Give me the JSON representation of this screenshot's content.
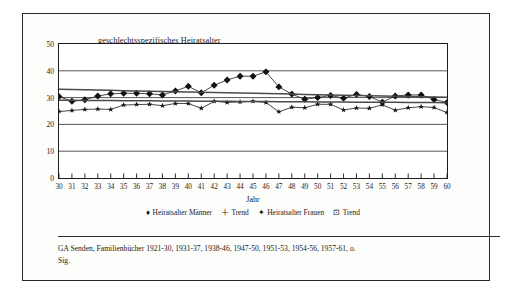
{
  "figure": {
    "title": "geschlechtsspezifisches Heiratsalter",
    "caption": "GA Senden, Familienbücher 1921-30, 1931-37, 1938-46, 1947-50, 1951-53, 1954-56, 1957-61, o. Sig."
  },
  "legend": {
    "items": [
      {
        "label": "Heiratsalter Männer",
        "glyph": "♦",
        "icon": "diamond-marker-icon"
      },
      {
        "label": "Trend",
        "glyph": "＋",
        "icon": "plus-marker-icon"
      },
      {
        "label": "Heiratsalter Frauen",
        "glyph": "✦",
        "icon": "star-marker-icon"
      },
      {
        "label": "Trend",
        "glyph": "⊡",
        "icon": "square-marker-icon"
      }
    ]
  },
  "chart_data": {
    "type": "line",
    "title": "geschlechtsspezifisches Heiratsalter",
    "xlabel": "Jahr",
    "ylabel": "",
    "xlim": [
      30,
      60
    ],
    "ylim": [
      0,
      50
    ],
    "yticks": [
      0,
      10,
      20,
      30,
      40,
      50
    ],
    "grid": "horizontal",
    "legend_position": "bottom",
    "x": [
      30,
      31,
      32,
      33,
      34,
      35,
      36,
      37,
      38,
      39,
      40,
      41,
      42,
      43,
      44,
      45,
      46,
      47,
      48,
      49,
      50,
      51,
      52,
      53,
      54,
      55,
      56,
      57,
      58,
      59,
      60
    ],
    "categories": [
      "30",
      "31",
      "32",
      "33",
      "34",
      "35",
      "36",
      "37",
      "38",
      "39",
      "40",
      "41",
      "42",
      "43",
      "44",
      "45",
      "46",
      "47",
      "48",
      "49",
      "50",
      "51",
      "52",
      "53",
      "54",
      "55",
      "56",
      "57",
      "58",
      "59",
      "60"
    ],
    "series": [
      {
        "name": "Heiratsalter Männer",
        "marker": "diamond",
        "values": [
          30.4,
          28.6,
          29.2,
          30.6,
          31.4,
          31.6,
          31.6,
          31.4,
          31.0,
          32.5,
          34.2,
          31.8,
          34.6,
          36.6,
          38.0,
          38.0,
          39.6,
          34.0,
          31.3,
          29.4,
          30.0,
          30.8,
          29.8,
          31.2,
          30.4,
          28.3,
          30.6,
          31.0,
          31.0,
          29.3,
          28.2
        ]
      },
      {
        "name": "Trend Männer",
        "marker": "plus",
        "trend": true,
        "values": [
          33.1,
          33.0,
          32.9,
          32.8,
          32.7,
          32.6,
          32.5,
          32.4,
          32.3,
          32.2,
          32.1,
          32.0,
          31.9,
          31.8,
          31.7,
          31.6,
          31.5,
          31.4,
          31.3,
          31.2,
          31.1,
          31.0,
          30.9,
          30.8,
          30.7,
          30.6,
          30.5,
          30.4,
          30.3,
          30.2,
          30.1
        ]
      },
      {
        "name": "Heiratsalter Frauen",
        "marker": "star",
        "values": [
          24.8,
          25.2,
          25.6,
          25.7,
          25.6,
          27.2,
          27.4,
          27.5,
          27.0,
          27.8,
          27.8,
          26.0,
          28.6,
          28.2,
          28.4,
          28.6,
          28.2,
          24.7,
          26.4,
          26.2,
          27.5,
          27.5,
          25.4,
          26.1,
          26.0,
          27.3,
          25.3,
          26.2,
          26.6,
          26.3,
          24.4
        ]
      },
      {
        "name": "Trend Frauen",
        "marker": "square",
        "trend": true,
        "values": [
          29.0,
          28.97,
          28.94,
          28.91,
          28.88,
          28.85,
          28.82,
          28.79,
          28.76,
          28.73,
          28.7,
          28.67,
          28.64,
          28.61,
          28.58,
          28.55,
          28.52,
          28.49,
          28.46,
          28.43,
          28.4,
          28.37,
          28.34,
          28.31,
          28.28,
          28.25,
          28.22,
          28.19,
          28.16,
          28.13,
          28.1
        ]
      }
    ],
    "colors": {
      "series": "#111111",
      "trend": "#555555",
      "axis": "#1c1c1c"
    }
  }
}
